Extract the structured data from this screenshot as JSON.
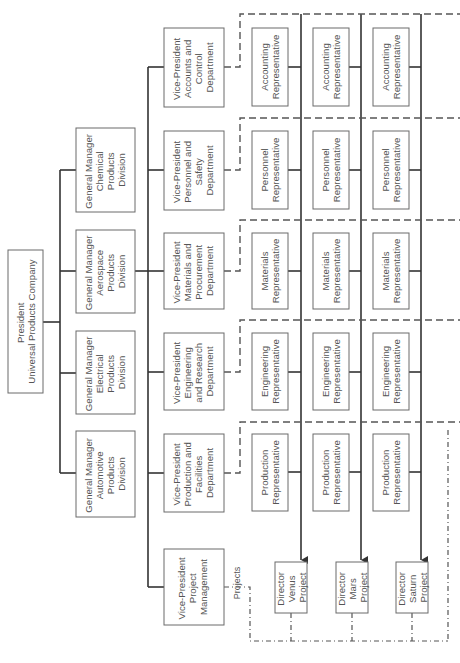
{
  "chart": {
    "orientation": "rotated-90-ccw",
    "president": {
      "lines": [
        "President",
        "Universal Products Company"
      ]
    },
    "divisions": [
      {
        "id": "chemical",
        "lines": [
          "General Manager",
          "Chemical",
          "Products",
          "Division"
        ]
      },
      {
        "id": "aerospace",
        "lines": [
          "General Manager",
          "Aerospace",
          "Products",
          "Division"
        ]
      },
      {
        "id": "electrical",
        "lines": [
          "General Manager",
          "Electrical",
          "Products",
          "Division"
        ]
      },
      {
        "id": "automotive",
        "lines": [
          "General Manager",
          "Automotive",
          "Products",
          "Division"
        ]
      }
    ],
    "vice_presidents": [
      {
        "id": "accounts",
        "lines": [
          "Vice-President",
          "Accounts and",
          "Control",
          "Department"
        ]
      },
      {
        "id": "personnel",
        "lines": [
          "Vice-President",
          "Personnel and",
          "Safety",
          "Department"
        ]
      },
      {
        "id": "materials",
        "lines": [
          "Vice-President",
          "Materials and",
          "Procurement",
          "Department"
        ]
      },
      {
        "id": "engineering",
        "lines": [
          "Vice-President",
          "Engineering",
          "and Research",
          "Department"
        ]
      },
      {
        "id": "production",
        "lines": [
          "Vice-President",
          "Production and",
          "Facilities",
          "Department"
        ]
      },
      {
        "id": "project-management",
        "lines": [
          "Vice-President",
          "Project",
          "Management"
        ]
      }
    ],
    "representatives": [
      {
        "row": "accounts",
        "lines": [
          "Accounting",
          "Representative"
        ]
      },
      {
        "row": "personnel",
        "lines": [
          "Personnel",
          "Representative"
        ]
      },
      {
        "row": "materials",
        "lines": [
          "Materials",
          "Representative"
        ]
      },
      {
        "row": "engineering",
        "lines": [
          "Engineering",
          "Representative"
        ]
      },
      {
        "row": "production",
        "lines": [
          "Production",
          "Representative"
        ]
      }
    ],
    "directors": [
      {
        "id": "venus",
        "lines": [
          "Director",
          "Venus",
          "Project"
        ]
      },
      {
        "id": "mars",
        "lines": [
          "Director",
          "Mars",
          "Project"
        ]
      },
      {
        "id": "saturn",
        "lines": [
          "Director",
          "Saturn",
          "Project"
        ]
      }
    ],
    "projects_label": "Projects",
    "colors": {
      "line": "#333333",
      "box_border": "#6a6a6a",
      "text": "#555555",
      "background": "#ffffff"
    }
  }
}
